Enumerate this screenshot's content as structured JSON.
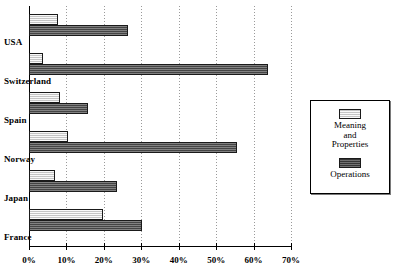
{
  "chart_data": {
    "type": "bar",
    "orientation": "horizontal",
    "title": "",
    "xlabel": "",
    "ylabel": "",
    "xlim": [
      0,
      70
    ],
    "xunit": "%",
    "grid": true,
    "legend_position": "right",
    "categories": [
      "USA",
      "Switzerland",
      "Spain",
      "Norway",
      "Japan",
      "France"
    ],
    "tick_labels": [
      "0%",
      "10%",
      "20%",
      "30%",
      "40%",
      "50%",
      "60%",
      "70%"
    ],
    "tick_values": [
      0,
      10,
      20,
      30,
      40,
      50,
      60,
      70
    ],
    "series": [
      {
        "name": "Meaning and Properties",
        "color": "#d9d9d9",
        "values": [
          7.8,
          3.7,
          8.3,
          10.4,
          7.0,
          19.8
        ]
      },
      {
        "name": "Operations",
        "color": "#5e5e5e",
        "values": [
          26.5,
          63.8,
          15.8,
          55.6,
          23.5,
          30.2
        ]
      }
    ]
  },
  "legend": {
    "entries": [
      {
        "label_line1": "Meaning",
        "label_line2": "and",
        "label_line3": "Properties",
        "swatch": "light-swatch"
      },
      {
        "label_line1": "Operations",
        "label_line2": "",
        "label_line3": "",
        "swatch": "dark-swatch"
      }
    ]
  }
}
